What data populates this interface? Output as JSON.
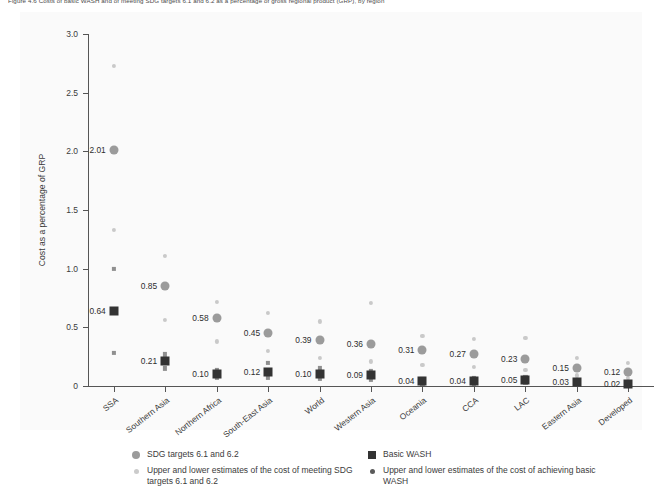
{
  "figure": {
    "caption": "Figure 4.6   Costs of basic WASH and of meeting SDG targets 6.1 and 6.2 as a percentage of gross regional product (GRP), by region"
  },
  "axes": {
    "y_title": "Cost as a percentage of GRP",
    "y_ticks": [
      "0",
      "0.5",
      "1.0",
      "1.5",
      "2.0",
      "2.5",
      "3.0"
    ],
    "y_tick_values": [
      0,
      0.5,
      1.0,
      1.5,
      2.0,
      2.5,
      3.0
    ]
  },
  "legend": {
    "items": [
      {
        "key": "sdg-main",
        "swatch": "circle-main",
        "label": "SDG targets 6.1 and 6.2"
      },
      {
        "key": "sdg-range",
        "swatch": "circle-light",
        "label": "Upper and lower estimates of the cost of meeting SDG targets 6.1 and 6.2"
      },
      {
        "key": "wash-main",
        "swatch": "square-main",
        "label": "Basic WASH"
      },
      {
        "key": "wash-range",
        "swatch": "circle-dark",
        "label": "Upper and lower estimates of the cost of achieving basic WASH"
      }
    ]
  },
  "colors": {
    "sdg_marker": "#9b9b9b",
    "sdg_estimate": "#c9c9c9",
    "wash_marker": "#333333",
    "wash_estimate": "#8f8f8f",
    "axis": "#555555",
    "panel_background": "#fafafa"
  },
  "chart_data": {
    "type": "scatter",
    "title": "Costs of basic WASH and of meeting SDG targets 6.1 and 6.2 as a percentage of gross regional product",
    "xlabel": "",
    "ylabel": "Cost as a percentage of GRP",
    "ylim": [
      0,
      3.0
    ],
    "grid": false,
    "legend_position": "below-axes",
    "categories": [
      "SSA",
      "Southern Asia",
      "Northern Africa",
      "South-East Asia",
      "World",
      "Western Asia",
      "Oceania",
      "CCA",
      "LAC",
      "Eastern Asia",
      "Developed"
    ],
    "series": [
      {
        "name": "SDG targets 6.1 and 6.2",
        "marker": "circle",
        "color": "#9b9b9b",
        "values": [
          2.01,
          0.85,
          0.58,
          0.45,
          0.39,
          0.36,
          0.31,
          0.27,
          0.23,
          0.15,
          0.12
        ],
        "labels": [
          "2.01",
          "0.85",
          "0.58",
          "0.45",
          "0.39",
          "0.36",
          "0.31",
          "0.27",
          "0.23",
          "0.15",
          "0.12"
        ]
      },
      {
        "name": "Basic WASH",
        "marker": "square",
        "color": "#333333",
        "values": [
          0.64,
          0.21,
          0.1,
          0.12,
          0.1,
          0.09,
          0.04,
          0.04,
          0.05,
          0.03,
          0.02
        ],
        "labels": [
          "0.64",
          "0.21",
          "0.10",
          "0.12",
          "0.10",
          "0.09",
          "0.04",
          "0.04",
          "0.05",
          "0.03",
          "0.02"
        ]
      },
      {
        "name": "Upper and lower estimates of the cost of meeting SDG targets 6.1 and 6.2",
        "marker": "small-circle",
        "color": "#c9c9c9",
        "upper": [
          2.73,
          1.11,
          0.72,
          0.62,
          0.55,
          0.71,
          0.43,
          0.4,
          0.41,
          0.24,
          0.2
        ],
        "lower": [
          1.33,
          0.56,
          0.38,
          0.3,
          0.24,
          0.21,
          0.18,
          0.16,
          0.14,
          0.09,
          0.07
        ]
      },
      {
        "name": "Upper and lower estimates of the cost of achieving basic WASH",
        "marker": "small-square",
        "color": "#8f8f8f",
        "upper": [
          1.0,
          0.27,
          0.14,
          0.2,
          0.15,
          0.13,
          0.06,
          0.07,
          0.08,
          0.05,
          0.03
        ],
        "lower": [
          0.28,
          0.15,
          0.07,
          0.07,
          0.06,
          0.05,
          0.02,
          0.02,
          0.03,
          0.02,
          0.01
        ]
      }
    ]
  }
}
